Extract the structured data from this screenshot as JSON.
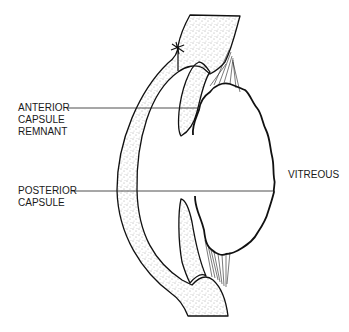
{
  "figure": {
    "type": "anatomical line drawing"
  },
  "labels": {
    "anterior_capsule": {
      "lines": [
        "ANTERIOR",
        "CAPSULE",
        "REMNANT"
      ]
    },
    "posterior_capsule": {
      "lines": [
        "POSTERIOR",
        "CAPSULE"
      ]
    },
    "vitreous": {
      "text": "VITREOUS"
    }
  },
  "colors": {
    "stroke": "#111111",
    "stipple": "#444444",
    "background": "#ffffff"
  }
}
